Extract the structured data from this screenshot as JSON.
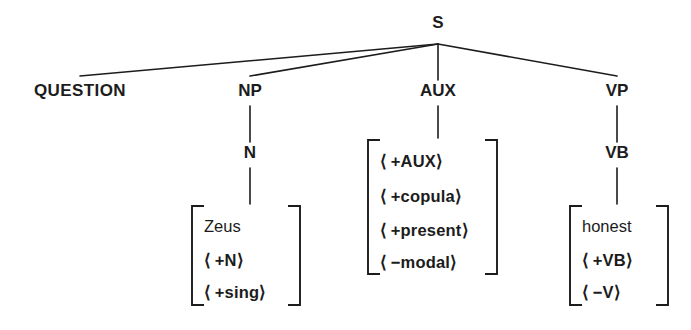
{
  "diagram": {
    "type": "syntax-tree",
    "background_color": "#ffffff",
    "ink_color": "#1c1c1c",
    "root": {
      "label": "S",
      "x": 438,
      "y": 28
    },
    "children": [
      {
        "id": "question",
        "label": "QUESTION",
        "x": 80,
        "y": 96,
        "has_bracket": false
      },
      {
        "id": "np",
        "label": "NP",
        "x": 250,
        "y": 96,
        "has_bracket": true,
        "child": {
          "label": "N",
          "x": 250,
          "y": 158
        },
        "bracket": {
          "left": 192,
          "right": 300,
          "top": 206,
          "bottom": 305,
          "text_x": 204,
          "items": [
            {
              "text": "Zeus",
              "style": "lexeme",
              "y": 232
            },
            {
              "text": "⟨ +N⟩",
              "style": "feat",
              "y": 266
            },
            {
              "text": "⟨ +sing⟩",
              "style": "feat",
              "y": 298
            }
          ]
        }
      },
      {
        "id": "aux",
        "label": "AUX",
        "x": 438,
        "y": 96,
        "has_bracket": true,
        "child": null,
        "bracket": {
          "left": 368,
          "right": 497,
          "top": 140,
          "bottom": 274,
          "text_x": 380,
          "items": [
            {
              "text": "⟨ +AUX⟩",
              "style": "feat",
              "y": 167
            },
            {
              "text": "⟨ +copula⟩",
              "style": "feat",
              "y": 202
            },
            {
              "text": "⟨ +present⟩",
              "style": "feat",
              "y": 236
            },
            {
              "text": "⟨ −modal⟩",
              "style": "feat",
              "y": 268
            }
          ]
        }
      },
      {
        "id": "vp",
        "label": "VP",
        "x": 617,
        "y": 96,
        "has_bracket": true,
        "child": {
          "label": "VB",
          "x": 617,
          "y": 158
        },
        "bracket": {
          "left": 570,
          "right": 668,
          "top": 206,
          "bottom": 305,
          "text_x": 582,
          "items": [
            {
              "text": "honest",
              "style": "lexeme",
              "y": 232
            },
            {
              "text": "⟨ +VB⟩",
              "style": "feat",
              "y": 266
            },
            {
              "text": "⟨ −V⟩",
              "style": "feat",
              "y": 298
            }
          ]
        }
      }
    ],
    "labels": {
      "root": "S",
      "question": "QUESTION",
      "np": "NP",
      "n": "N",
      "aux": "AUX",
      "vp": "VP",
      "vb": "VB"
    }
  }
}
